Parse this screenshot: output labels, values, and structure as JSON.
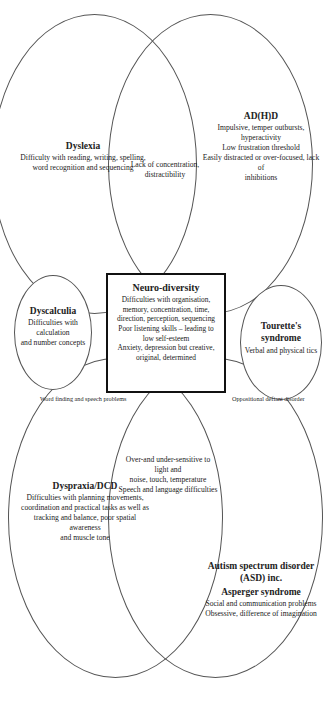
{
  "diagram": {
    "title": "Neuro-diversity",
    "center": {
      "title": "Neuro-diversity",
      "lines": [
        "Difficulties with organisation,",
        "memory, concentration, time,",
        "direction, perception, sequencing",
        "Poor listening skills – leading to",
        "low self-esteem",
        "Anxiety, depression but creative,",
        "original, determined"
      ]
    },
    "dyslexia": {
      "title": "Dyslexia",
      "lines": [
        "Difficulty with reading, writing, spelling,",
        "word recognition and sequencing"
      ]
    },
    "adhd": {
      "title": "AD(H)D",
      "lines": [
        "Impulsive, temper outbursts, hyperactivity",
        "Low frustration threshold",
        "Easily distracted or over-focused, lack of",
        "inhibitions"
      ]
    },
    "dyslexia_adhd_overlap": {
      "lines": [
        "Lack of concentration,",
        "distractibility"
      ]
    },
    "dyscalculia": {
      "title": "Dyscalculia",
      "lines": [
        "Difficulties with calculation",
        "and number concepts"
      ]
    },
    "word_finding": {
      "label": "Word finding and speech problems"
    },
    "oppositional": {
      "label": "Oppositional defiant disorder"
    },
    "tourettes": {
      "title": "Tourette's syndrome",
      "lines": [
        "Verbal and physical tics"
      ]
    },
    "dyspraxia": {
      "title": "Dyspraxia/DCD",
      "lines": [
        "Difficulties with planning movements,",
        "coordination and practical tasks as well as",
        "tracking and balance, poor spatial awareness",
        "and muscle tone"
      ]
    },
    "dyspraxia_asd_overlap": {
      "lines": [
        "Over-and under-sensitive to light and",
        "noise, touch, temperature",
        "Speech and language difficulties"
      ]
    },
    "asd": {
      "title": "Autism spectrum disorder (ASD) inc.",
      "subtitle": "Asperger syndrome",
      "lines": [
        "Social and communication problems",
        "Obsessive, difference of imagination"
      ]
    }
  }
}
